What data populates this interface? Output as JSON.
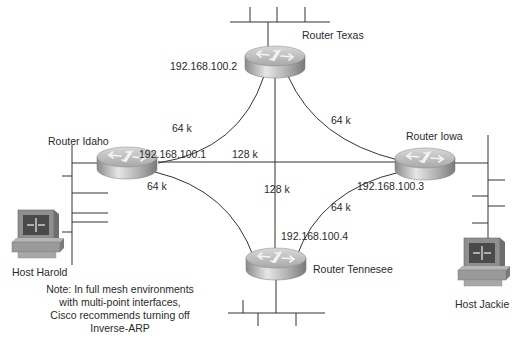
{
  "diagram": {
    "routers": [
      {
        "id": "texas",
        "name": "Router Texas",
        "ip": "192.168.100.2",
        "cx": 275,
        "cy": 62
      },
      {
        "id": "idaho",
        "name": "Router Idaho",
        "ip": "192.168.100.1",
        "cx": 130,
        "cy": 163
      },
      {
        "id": "iowa",
        "name": "Router Iowa",
        "ip": "192.168.100.3",
        "cx": 425,
        "cy": 163
      },
      {
        "id": "tennesee",
        "name": "Router Tennesee",
        "ip": "192.168.100.4",
        "cx": 275,
        "cy": 265
      }
    ],
    "links": [
      {
        "from": "idaho",
        "to": "texas",
        "speed": "64 k"
      },
      {
        "from": "texas",
        "to": "iowa",
        "speed": "64 k"
      },
      {
        "from": "idaho",
        "to": "tennesee",
        "speed": "64 k"
      },
      {
        "from": "iowa",
        "to": "tennesee",
        "speed": "64 k"
      },
      {
        "from": "idaho",
        "to": "iowa",
        "speed": "128 k"
      },
      {
        "from": "texas",
        "to": "tennesee",
        "speed": "128 k"
      }
    ],
    "hosts": [
      {
        "id": "harold",
        "name": "Host Harold"
      },
      {
        "id": "jackie",
        "name": "Host Jackie"
      }
    ],
    "note": "Note: In full mesh environments with multi-point interfaces, Cisco recommends turning off Inverse-ARP",
    "colors": {
      "line": "#333333",
      "router_top": "#c8c8c8",
      "router_side": "#9a9a9a",
      "host_body": "#8f8f8f",
      "host_screen": "#4a4a4a"
    }
  }
}
